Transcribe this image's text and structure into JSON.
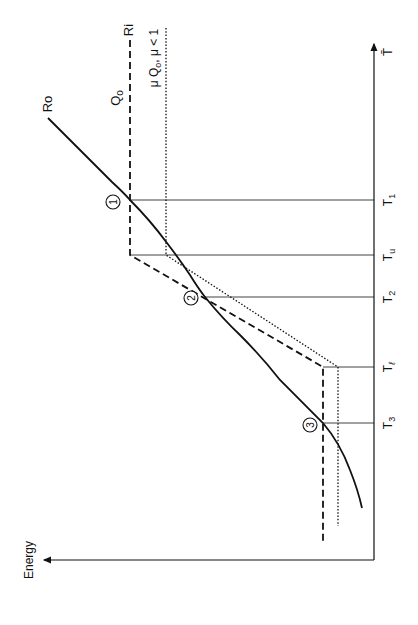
{
  "diagram": {
    "orientation": "rotated-90-ccw",
    "axes": {
      "energy_label": "Energy",
      "temperature_label": "T̄"
    },
    "curves": {
      "ro_label": "Ro",
      "ri_label": "Ri",
      "q0_label": "Q",
      "q0_sub": "o",
      "mu_q0_label": "μ Q",
      "mu_q0_sub": "o",
      "mu_q0_cond": ", μ < 1"
    },
    "ticks": [
      {
        "label": "T",
        "sub": "1"
      },
      {
        "label": "T",
        "sub": "u"
      },
      {
        "label": "T",
        "sub": "2"
      },
      {
        "label": "T",
        "sub": "ℓ"
      },
      {
        "label": "T",
        "sub": "3"
      }
    ],
    "points": [
      "1",
      "2",
      "3"
    ],
    "colors": {
      "ink": "#111111",
      "background": "#ffffff"
    }
  }
}
